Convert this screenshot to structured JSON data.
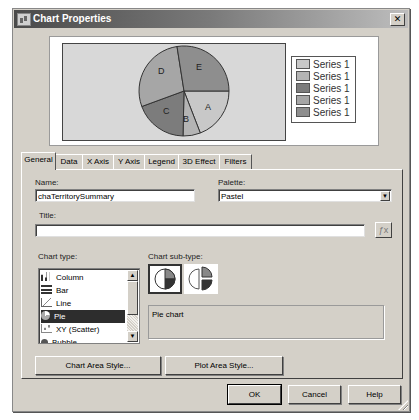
{
  "window": {
    "title": "Chart Properties",
    "close_label": "✕"
  },
  "preview": {
    "pie_labels": [
      "A",
      "B",
      "C",
      "D",
      "E"
    ],
    "legend": [
      "Series 1",
      "Series 1",
      "Series 1",
      "Series 1",
      "Series 1"
    ],
    "colors": [
      "#c8c8c8",
      "#b4b4b4",
      "#7c7c7c",
      "#a6a6a6",
      "#8e8e8e"
    ]
  },
  "tabs": [
    {
      "label": "General",
      "active": true
    },
    {
      "label": "Data"
    },
    {
      "label": "X Axis"
    },
    {
      "label": "Y Axis"
    },
    {
      "label": "Legend"
    },
    {
      "label": "3D Effect"
    },
    {
      "label": "Filters"
    }
  ],
  "general": {
    "name_label": "Name:",
    "name_value": "chaTerritorySummary",
    "palette_label": "Palette:",
    "palette_value": "Pastel",
    "title_label": "Title:",
    "title_value": "",
    "chart_type_label": "Chart type:",
    "chart_types": [
      "Column",
      "Bar",
      "Line",
      "Pie",
      "XY (Scatter)",
      "Bubble"
    ],
    "chart_type_selected": "Pie",
    "subtype_label": "Chart sub-type:",
    "subtypes": [
      "Pie chart",
      "Exploded pie chart"
    ],
    "subtype_description": "Pie chart",
    "chart_area_style_label": "Chart Area Style...",
    "plot_area_style_label": "Plot Area Style..."
  },
  "footer": {
    "ok_label": "OK",
    "cancel_label": "Cancel",
    "help_label": "Help"
  }
}
